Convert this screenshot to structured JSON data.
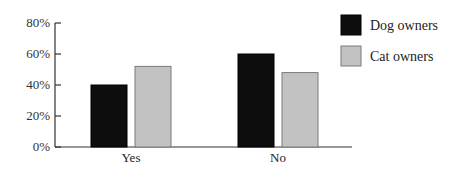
{
  "chart_data": {
    "type": "bar",
    "title": "",
    "xlabel": "",
    "ylabel": "",
    "categories": [
      "Yes",
      "No"
    ],
    "series": [
      {
        "name": "Dog owners",
        "values": [
          40,
          60
        ],
        "color": "#0d0d0d"
      },
      {
        "name": "Cat owners",
        "values": [
          52,
          48
        ],
        "color": "#c2c2c2"
      }
    ],
    "ylim": [
      0,
      80
    ],
    "yticks": [
      0,
      20,
      40,
      60,
      80
    ],
    "ytick_labels": [
      "0%",
      "20%",
      "40%",
      "60%",
      "80%"
    ],
    "grid": false,
    "legend_position": "top-right"
  }
}
